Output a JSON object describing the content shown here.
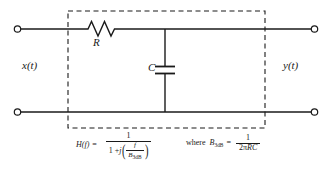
{
  "figure": {
    "colors": {
      "line": "#1a1a1a",
      "background": "#ffffff",
      "dashed_box": "#1a1a1a"
    },
    "components": {
      "resistor_label": "R",
      "capacitor_label": "C",
      "input_label": "x(t)",
      "output_label": "y(t)"
    },
    "terminals": {
      "input_top": "input-top-terminal",
      "input_bottom": "input-bottom-terminal",
      "output_top": "output-top-terminal",
      "output_bottom": "output-bottom-terminal"
    },
    "dashed_box": {
      "present": true,
      "meaning": "filter-boundary"
    }
  },
  "formula": {
    "transfer_function": {
      "lhs": "H(f)",
      "equals": "=",
      "numerator": "1",
      "denominator_prefix": "1 +",
      "denominator_j": "j",
      "denominator_slash": "/",
      "inner_numerator": "f",
      "inner_denominator_base": "B",
      "inner_denominator_sub": "3dB",
      "open_paren": "(",
      "close_paren": ")",
      "plain": "H(f) = 1 / (1 + j(f/B_3dB))"
    },
    "bandwidth": {
      "where": "where",
      "symbol_base": "B",
      "symbol_sub": "3dB",
      "equals": "=",
      "numerator": "1",
      "denominator": "2πRC",
      "denominator_two": "2",
      "denominator_pi": "π",
      "denominator_rc": "RC",
      "plain": "where B_3dB = 1 / (2πRC)"
    }
  }
}
